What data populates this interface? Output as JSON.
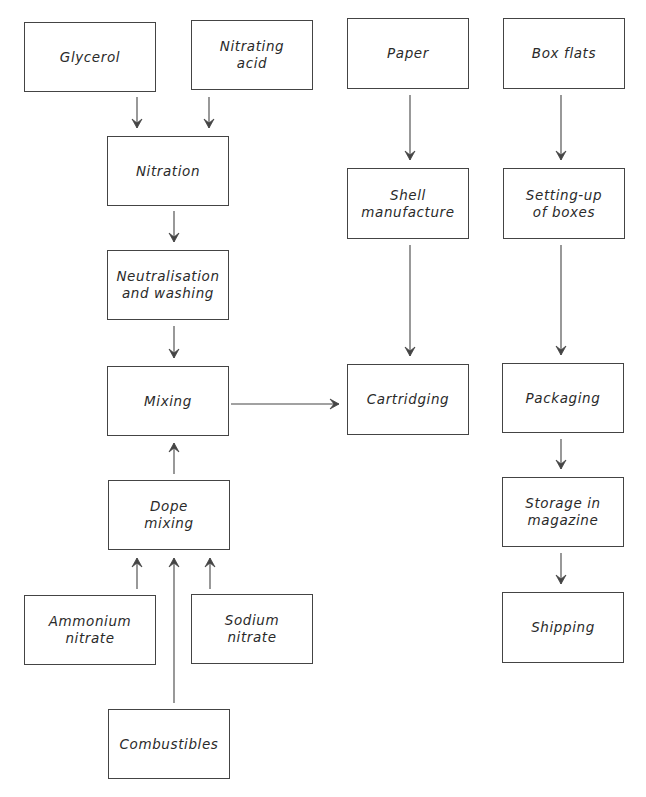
{
  "diagram": {
    "nodes": [
      {
        "id": "glycerol",
        "label": "Glycerol",
        "x": 24,
        "y": 22,
        "w": 132,
        "h": 70
      },
      {
        "id": "nitrating_acid",
        "label": "Nitrating\nacid",
        "x": 191,
        "y": 20,
        "w": 122,
        "h": 70
      },
      {
        "id": "nitration",
        "label": "Nitration",
        "x": 107,
        "y": 136,
        "w": 122,
        "h": 70
      },
      {
        "id": "neutralisation",
        "label": "Neutralisation\nand washing",
        "x": 107,
        "y": 250,
        "w": 122,
        "h": 70
      },
      {
        "id": "mixing",
        "label": "Mixing",
        "x": 107,
        "y": 366,
        "w": 122,
        "h": 70
      },
      {
        "id": "dope_mixing",
        "label": "Dope\nmixing",
        "x": 108,
        "y": 480,
        "w": 122,
        "h": 70
      },
      {
        "id": "ammonium_nitrate",
        "label": "Ammonium\nnitrate",
        "x": 24,
        "y": 595,
        "w": 132,
        "h": 70
      },
      {
        "id": "sodium_nitrate",
        "label": "Sodium\nnitrate",
        "x": 191,
        "y": 594,
        "w": 122,
        "h": 70
      },
      {
        "id": "combustibles",
        "label": "Combustibles",
        "x": 108,
        "y": 709,
        "w": 122,
        "h": 70
      },
      {
        "id": "paper",
        "label": "Paper",
        "x": 347,
        "y": 18,
        "w": 122,
        "h": 71
      },
      {
        "id": "box_flats",
        "label": "Box flats",
        "x": 503,
        "y": 18,
        "w": 122,
        "h": 71
      },
      {
        "id": "shell_manufacture",
        "label": "Shell\nmanufacture",
        "x": 347,
        "y": 168,
        "w": 122,
        "h": 71
      },
      {
        "id": "setting_up_boxes",
        "label": "Setting-up\nof boxes",
        "x": 503,
        "y": 168,
        "w": 122,
        "h": 71
      },
      {
        "id": "cartridging",
        "label": "Cartridging",
        "x": 347,
        "y": 364,
        "w": 122,
        "h": 71
      },
      {
        "id": "packaging",
        "label": "Packaging",
        "x": 502,
        "y": 363,
        "w": 122,
        "h": 70
      },
      {
        "id": "storage_magazine",
        "label": "Storage in\nmagazine",
        "x": 502,
        "y": 477,
        "w": 122,
        "h": 70
      },
      {
        "id": "shipping",
        "label": "Shipping",
        "x": 502,
        "y": 592,
        "w": 122,
        "h": 71
      }
    ],
    "edges": [
      {
        "from": "glycerol",
        "to": "nitration",
        "points": [
          [
            137,
            97
          ],
          [
            137,
            128
          ]
        ]
      },
      {
        "from": "nitrating_acid",
        "to": "nitration",
        "points": [
          [
            209,
            97
          ],
          [
            209,
            128
          ]
        ]
      },
      {
        "from": "nitration",
        "to": "neutralisation",
        "points": [
          [
            174,
            211
          ],
          [
            174,
            242
          ]
        ]
      },
      {
        "from": "neutralisation",
        "to": "mixing",
        "points": [
          [
            174,
            326
          ],
          [
            174,
            358
          ]
        ]
      },
      {
        "from": "dope_mixing",
        "to": "mixing",
        "points": [
          [
            174,
            474
          ],
          [
            174,
            443
          ]
        ]
      },
      {
        "from": "ammonium_nitrate",
        "to": "dope_mixing",
        "points": [
          [
            137,
            589
          ],
          [
            137,
            558
          ]
        ]
      },
      {
        "from": "combustibles",
        "to": "dope_mixing",
        "points": [
          [
            174,
            703
          ],
          [
            174,
            558
          ]
        ]
      },
      {
        "from": "sodium_nitrate",
        "to": "dope_mixing",
        "points": [
          [
            210,
            589
          ],
          [
            210,
            558
          ]
        ]
      },
      {
        "from": "mixing",
        "to": "cartridging",
        "points": [
          [
            231,
            404
          ],
          [
            339,
            404
          ]
        ]
      },
      {
        "from": "paper",
        "to": "shell_manufacture",
        "points": [
          [
            410,
            95
          ],
          [
            410,
            160
          ]
        ]
      },
      {
        "from": "shell_manufacture",
        "to": "cartridging",
        "points": [
          [
            410,
            245
          ],
          [
            410,
            356
          ]
        ]
      },
      {
        "from": "box_flats",
        "to": "setting_up_boxes",
        "points": [
          [
            561,
            95
          ],
          [
            561,
            160
          ]
        ]
      },
      {
        "from": "setting_up_boxes",
        "to": "packaging",
        "points": [
          [
            561,
            245
          ],
          [
            561,
            355
          ]
        ]
      },
      {
        "from": "packaging",
        "to": "storage_magazine",
        "points": [
          [
            561,
            439
          ],
          [
            561,
            469
          ]
        ]
      },
      {
        "from": "storage_magazine",
        "to": "shipping",
        "points": [
          [
            561,
            553
          ],
          [
            561,
            584
          ]
        ]
      }
    ],
    "colors": {
      "line": "#444444",
      "text": "#2a2a2a",
      "background": "#ffffff"
    }
  }
}
